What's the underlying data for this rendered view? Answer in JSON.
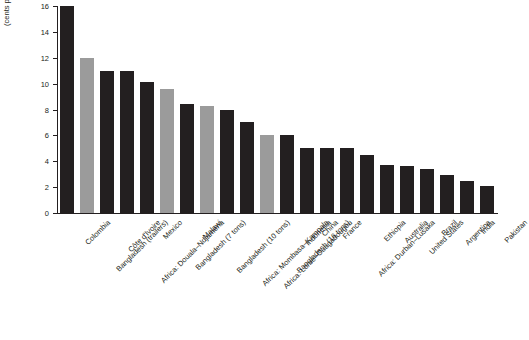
{
  "chart_data": {
    "type": "bar",
    "title": "",
    "xlabel": "",
    "ylabel": "Trucking rates (cents per ton per kilometer)",
    "ylabel_lines": [
      "Trucking rates",
      "(cents per ton per kilometer)"
    ],
    "ylim": [
      0,
      16
    ],
    "yticks": [
      0,
      2,
      4,
      6,
      8,
      10,
      12,
      14,
      16
    ],
    "ytick_labels": [
      "0",
      "2",
      "4",
      "6",
      "8",
      "10",
      "12",
      "14",
      "16"
    ],
    "grid": false,
    "legend": "none",
    "categories": [
      "Colombia",
      "Bangladesh (trailers)",
      "Côte d'Ivoire",
      "Africa: Douala–Ndjaména",
      "Mexico",
      "Bangladesh (7 tons)",
      "Malawi",
      "Bangladesh (10 tons)",
      "Africa: Mombasa–Kampala",
      "Africa: Lomé–Ouagadougou",
      "Bangladesh (16 tons)",
      "Indonesia",
      "China",
      "France",
      "Africa: Durban–Lusaka",
      "Ethiopia",
      "Australia",
      "United States",
      "Brazil",
      "Argentina",
      "India",
      "Pakistan"
    ],
    "values": [
      16.0,
      12.0,
      11.0,
      11.0,
      10.1,
      9.6,
      8.4,
      8.3,
      8.0,
      7.0,
      6.0,
      6.0,
      5.0,
      5.0,
      5.0,
      4.5,
      3.7,
      3.6,
      3.4,
      2.9,
      2.5,
      2.1
    ],
    "bar_colors": [
      "#231f20",
      "#9b9b9b",
      "#231f20",
      "#231f20",
      "#231f20",
      "#9b9b9b",
      "#231f20",
      "#9b9b9b",
      "#231f20",
      "#231f20",
      "#9b9b9b",
      "#231f20",
      "#231f20",
      "#231f20",
      "#231f20",
      "#231f20",
      "#231f20",
      "#231f20",
      "#231f20",
      "#231f20",
      "#231f20",
      "#231f20"
    ],
    "colors": {
      "dark_bar": "#231f20",
      "light_bar": "#9b9b9b",
      "axis": "#231f20",
      "background": "#ffffff"
    }
  }
}
